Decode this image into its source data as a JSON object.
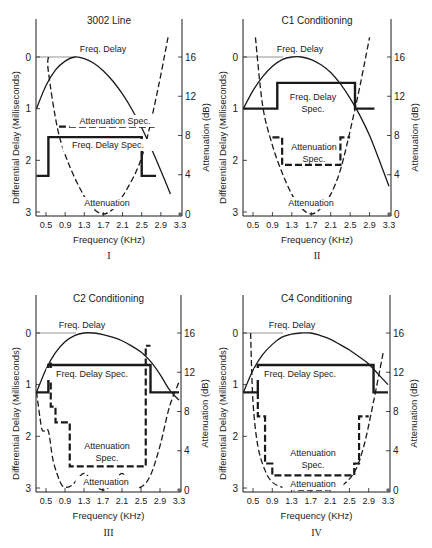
{
  "figure": {
    "x_axis_label": "Frequency (KHz)",
    "left_axis_label": "Differential Delay (Milliseconds)",
    "right_axis_label": "Attenuation (dB)",
    "x_ticks": [
      "0.5",
      "0.9",
      "1.3",
      "1.7",
      "2.1",
      "2.5",
      "2.9",
      "3.3"
    ],
    "left_ticks": [
      "0",
      "1",
      "2",
      "3"
    ],
    "right_ticks": [
      "16",
      "12",
      "8",
      "4",
      "0"
    ],
    "colors": {
      "line": "#1a1a1a",
      "text": "#222222",
      "background": "#ffffff"
    }
  },
  "chart_data": [
    {
      "type": "line",
      "numeral": "I",
      "title": "3002 Line",
      "xlabel": "Frequency (KHz)",
      "ylabel": "Differential Delay (Milliseconds)",
      "y2label": "Attenuation (dB)",
      "xlim": [
        0.3,
        3.3
      ],
      "ylim": [
        3,
        0
      ],
      "y2lim": [
        0,
        16
      ],
      "annotations": [
        "Freq. Delay",
        "Attenuation Spec.",
        "Freq. Delay Spec.",
        "Attenuation"
      ],
      "series": [
        {
          "name": "Freq. Delay",
          "axis": "left",
          "style": "solid-thin",
          "x": [
            0.3,
            0.5,
            0.7,
            0.9,
            1.1,
            1.3,
            1.5,
            1.7,
            1.9,
            2.1,
            2.3,
            2.5,
            2.7,
            2.9,
            3.1
          ],
          "y": [
            1.0,
            0.55,
            0.25,
            0.08,
            0.0,
            0.03,
            0.12,
            0.27,
            0.47,
            0.72,
            1.02,
            1.37,
            1.77,
            2.2,
            2.65
          ]
        },
        {
          "name": "Freq. Delay Spec.",
          "axis": "left",
          "style": "step-thick",
          "x": [
            0.3,
            0.55,
            0.55,
            2.5,
            2.5,
            2.8
          ],
          "y": [
            2.3,
            2.3,
            1.55,
            1.55,
            2.3,
            2.3
          ]
        },
        {
          "name": "Attenuation Spec.",
          "axis": "right",
          "style": "dashed-thick",
          "x": [
            0.77,
            2.77
          ],
          "y": [
            8.9,
            8.9
          ]
        },
        {
          "name": "Attenuation",
          "axis": "right",
          "style": "dashed-thin",
          "x": [
            0.55,
            0.55,
            0.75,
            1.0,
            1.3,
            1.5,
            1.7,
            1.9,
            2.1,
            2.4,
            2.6,
            2.85,
            3.05
          ],
          "y": [
            16,
            14.5,
            8.5,
            4.8,
            1.8,
            0.5,
            0,
            0.5,
            1.8,
            4.5,
            7.5,
            13,
            18
          ]
        }
      ]
    },
    {
      "type": "line",
      "numeral": "II",
      "title": "C1 Conditioning",
      "xlabel": "Frequency (KHz)",
      "ylabel": "Differential Delay (Milliseconds)",
      "y2label": "Attenuation (dB)",
      "xlim": [
        0.3,
        3.3
      ],
      "ylim": [
        3,
        0
      ],
      "y2lim": [
        0,
        16
      ],
      "annotations": [
        "Freq. Delay",
        "Freq. Delay Spec.",
        "Attenuation Spec.",
        "Attenuation"
      ],
      "series": [
        {
          "name": "Freq. Delay",
          "axis": "left",
          "style": "solid-thin",
          "x": [
            0.3,
            0.5,
            0.7,
            0.9,
            1.1,
            1.3,
            1.5,
            1.7,
            1.9,
            2.1,
            2.3,
            2.5,
            2.7,
            2.9,
            3.1,
            3.3
          ],
          "y": [
            1.0,
            0.65,
            0.38,
            0.18,
            0.05,
            0.0,
            0.0,
            0.05,
            0.15,
            0.3,
            0.52,
            0.8,
            1.13,
            1.52,
            2.0,
            2.5
          ]
        },
        {
          "name": "Freq. Delay Spec.",
          "axis": "left",
          "style": "step-thick",
          "x": [
            0.3,
            1.0,
            1.0,
            2.6,
            2.6,
            3.0
          ],
          "y": [
            1.0,
            1.0,
            0.5,
            0.5,
            1.0,
            1.0
          ]
        },
        {
          "name": "Attenuation Spec.",
          "axis": "right",
          "style": "dashed-thick",
          "x": [
            0.9,
            1.1,
            1.1,
            2.3,
            2.3,
            2.5
          ],
          "y": [
            7.8,
            7.8,
            5.0,
            5.0,
            7.8,
            7.8
          ]
        },
        {
          "name": "Attenuation",
          "axis": "right",
          "style": "dashed-thin",
          "x": [
            0.55,
            0.7,
            0.9,
            1.1,
            1.3,
            1.5,
            1.7,
            1.9,
            2.1,
            2.3,
            2.5,
            2.7,
            2.9
          ],
          "y": [
            18,
            11,
            7,
            4.2,
            2.0,
            0.6,
            0,
            0.6,
            2.0,
            4.5,
            8.5,
            13,
            18
          ]
        }
      ]
    },
    {
      "type": "line",
      "numeral": "III",
      "title": "C2 Conditioning",
      "xlabel": "Frequency (KHz)",
      "ylabel": "Differential Delay (Milliseconds)",
      "y2label": "Attenuation (dB)",
      "xlim": [
        0.3,
        3.3
      ],
      "ylim": [
        3,
        0
      ],
      "y2lim": [
        0,
        16
      ],
      "annotations": [
        "Freq. Delay",
        "Freq. Delay Spec.",
        "Attenuation Spec.",
        "Attenuation"
      ],
      "series": [
        {
          "name": "Freq. Delay",
          "axis": "left",
          "style": "solid-thin",
          "x": [
            0.3,
            0.5,
            0.7,
            0.9,
            1.1,
            1.3,
            1.5,
            1.7,
            1.9,
            2.1,
            2.3,
            2.5,
            2.7,
            2.9,
            3.1,
            3.3
          ],
          "y": [
            1.15,
            0.7,
            0.38,
            0.17,
            0.05,
            0.0,
            0.0,
            0.03,
            0.08,
            0.15,
            0.25,
            0.37,
            0.55,
            0.8,
            1.1,
            1.3
          ]
        },
        {
          "name": "Freq. Delay Spec.",
          "axis": "left",
          "style": "step-thick",
          "x": [
            0.3,
            0.55,
            0.55,
            2.7,
            2.7,
            3.3
          ],
          "y": [
            1.15,
            1.15,
            0.62,
            0.62,
            1.15,
            1.15
          ]
        },
        {
          "name": "Attenuation Spec.",
          "axis": "right",
          "style": "dashed-thick",
          "x": [
            0.6,
            0.6,
            0.7,
            0.7,
            1.0,
            1.0,
            2.6,
            2.6,
            2.7
          ],
          "y": [
            13,
            8.5,
            8.5,
            6.9,
            6.9,
            2.4,
            2.4,
            14.7,
            14.7
          ]
        },
        {
          "name": "Attenuation",
          "axis": "right",
          "style": "dashed-thin",
          "x": [
            0.3,
            0.4,
            0.45,
            0.55,
            0.65,
            0.8,
            0.9,
            1.05,
            1.3,
            1.5,
            1.7,
            1.9,
            2.1,
            2.3,
            2.5,
            2.7,
            2.9,
            3.1,
            3.3
          ],
          "y": [
            10,
            6.5,
            6.0,
            6.0,
            3.0,
            0.8,
            0.3,
            0.5,
            1.7,
            0.6,
            0,
            0.6,
            1.7,
            0.5,
            0.3,
            1.5,
            4.5,
            8.5,
            11
          ]
        }
      ]
    },
    {
      "type": "line",
      "numeral": "IV",
      "title": "C4 Conditioning",
      "xlabel": "Frequency (KHz)",
      "ylabel": "Differential Delay (Milliseconds)",
      "y2label": "Attenuation (dB)",
      "xlim": [
        0.3,
        3.3
      ],
      "ylim": [
        3,
        0
      ],
      "y2lim": [
        0,
        16
      ],
      "annotations": [
        "Freq. Delay",
        "Freq. Delay Spec.",
        "Attenuation Spec.",
        "Attenuation"
      ],
      "series": [
        {
          "name": "Freq. Delay",
          "axis": "left",
          "style": "solid-thin",
          "x": [
            0.3,
            0.5,
            0.7,
            0.9,
            1.1,
            1.3,
            1.5,
            1.7,
            1.9,
            2.1,
            2.3,
            2.5,
            2.7,
            2.9,
            3.1,
            3.3
          ],
          "y": [
            1.15,
            0.72,
            0.42,
            0.22,
            0.08,
            0.02,
            0.0,
            0.0,
            0.05,
            0.12,
            0.22,
            0.33,
            0.46,
            0.6,
            0.8,
            1.0
          ]
        },
        {
          "name": "Freq. Delay Spec.",
          "axis": "left",
          "style": "step-thick",
          "x": [
            0.3,
            0.6,
            0.6,
            3.0,
            3.0,
            3.3
          ],
          "y": [
            1.15,
            1.15,
            0.62,
            0.62,
            1.15,
            1.15
          ]
        },
        {
          "name": "Attenuation Spec.",
          "axis": "right",
          "style": "dashed-thick",
          "x": [
            0.6,
            0.6,
            0.75,
            0.75,
            0.9,
            0.9,
            2.6,
            2.6,
            2.7,
            2.7,
            2.9
          ],
          "y": [
            10,
            7.5,
            7.5,
            2.7,
            2.7,
            1.5,
            1.5,
            2.7,
            2.7,
            7.5,
            7.5
          ]
        },
        {
          "name": "Attenuation",
          "axis": "right",
          "style": "dashed-thin",
          "x": [
            0.45,
            0.5,
            0.6,
            0.75,
            0.9,
            1.1,
            1.4,
            1.7,
            2.0,
            2.3,
            2.6,
            2.8,
            3.0,
            3.2
          ],
          "y": [
            16,
            9.0,
            4.5,
            2.0,
            0.8,
            0.3,
            0,
            0,
            0,
            0.3,
            1.8,
            4.5,
            9,
            14
          ]
        }
      ]
    }
  ]
}
